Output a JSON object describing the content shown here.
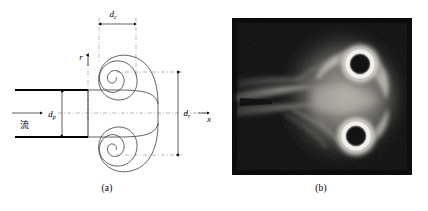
{
  "figure": {
    "panels": [
      {
        "id": "a",
        "caption": "(a)",
        "kind": "schematic",
        "title_role": "vortex-ring-formation-schematic",
        "axes": {
          "vertical_label": "r",
          "horizontal_label": "x"
        },
        "annotations": {
          "flow_label": "流",
          "core_diameter_label": "d",
          "core_diameter_subscript": "c",
          "pipe_diameter_label": "d",
          "pipe_diameter_subscript": "p",
          "ring_diameter_label": "d",
          "ring_diameter_subscript": "r"
        },
        "elements": {
          "spiral_turns": 2.6,
          "spiral_count": 2,
          "pipe_wall_count": 2
        }
      },
      {
        "id": "b",
        "caption": "(b)",
        "kind": "photograph",
        "title_role": "vortex-ring-flow-visualization-photo",
        "features": {
          "vortex_core_count": 2,
          "background": "#0d0d0d",
          "smoke_highlight": "#e8e6e0"
        }
      }
    ]
  },
  "colors": {
    "ink": "#000000",
    "line": "#3a3a3a",
    "dashed_guide": "#8a8a8a",
    "photo_dark": "#0d0d0d",
    "photo_light": "#efede8",
    "page_background": "#ffffff"
  }
}
